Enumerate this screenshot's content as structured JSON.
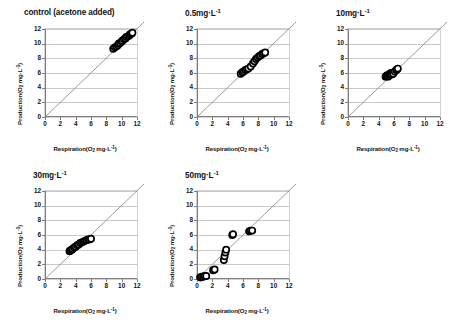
{
  "figure": {
    "axis_titles": {
      "x": "Respiration(O2 mg·L-1)",
      "y": "Production(O2 mg·L-1)"
    },
    "ticks": {
      "x": [
        "0",
        "2",
        "4",
        "6",
        "8",
        "10",
        "12"
      ],
      "y": [
        "0",
        "2",
        "4",
        "6",
        "8",
        "10",
        "12"
      ]
    },
    "colors": {
      "gridline": "#c9c9c9",
      "axis": "#7f7f7f",
      "reference_line": "#808080",
      "marker_stroke": "#000000",
      "marker_fill": "#ffffff",
      "text": "#131313",
      "background": "#ffffff"
    }
  },
  "chart_data": [
    {
      "type": "scatter",
      "title": "control (acetone added)",
      "xlabel": "Respiration(O2 mg·L-1)",
      "ylabel": "Production(O2 mg·L-1)",
      "xlim": [
        0,
        12
      ],
      "ylim": [
        0,
        12
      ],
      "xticks": [
        0,
        2,
        4,
        6,
        8,
        10,
        12
      ],
      "yticks": [
        0,
        2,
        4,
        6,
        8,
        10,
        12
      ],
      "grid": "horizontal",
      "reference_line": {
        "type": "identity",
        "slope": 1,
        "intercept": 0,
        "label": "1:1 line"
      },
      "x": [
        8.9,
        9.1,
        9.3,
        9.5,
        9.6,
        9.8,
        10.0,
        10.1,
        10.3,
        10.5,
        10.6,
        10.8,
        11.0,
        11.1,
        11.3,
        11.4
      ],
      "y": [
        9.3,
        9.5,
        9.6,
        9.8,
        10.0,
        10.1,
        10.3,
        10.4,
        10.6,
        10.7,
        10.9,
        11.0,
        11.1,
        11.3,
        11.4,
        11.5
      ]
    },
    {
      "type": "scatter",
      "title": "0.5mg·L-1",
      "xlabel": "Respiration(O2 mg·L-1)",
      "ylabel": "Production(O2 mg·L-1)",
      "xlim": [
        0,
        12
      ],
      "ylim": [
        0,
        12
      ],
      "xticks": [
        0,
        2,
        4,
        6,
        8,
        10,
        12
      ],
      "yticks": [
        0,
        2,
        4,
        6,
        8,
        10,
        12
      ],
      "grid": "horizontal",
      "reference_line": {
        "type": "identity",
        "slope": 1,
        "intercept": 0,
        "label": "1:1 line"
      },
      "x": [
        5.7,
        5.9,
        6.1,
        6.3,
        6.5,
        6.7,
        7.0,
        7.3,
        7.5,
        7.7,
        7.9,
        8.1,
        8.3,
        8.5,
        8.7,
        8.9
      ],
      "y": [
        5.9,
        6.1,
        6.2,
        6.4,
        6.5,
        6.6,
        6.9,
        7.3,
        7.6,
        7.9,
        8.1,
        8.3,
        8.4,
        8.6,
        8.7,
        8.8
      ]
    },
    {
      "type": "scatter",
      "title": "10mg·L-1",
      "xlabel": "Respiration(O2 mg·L-1)",
      "ylabel": "Production(O2 mg·L-1)",
      "xlim": [
        0,
        12
      ],
      "ylim": [
        0,
        12
      ],
      "xticks": [
        0,
        2,
        4,
        6,
        8,
        10,
        12
      ],
      "yticks": [
        0,
        2,
        4,
        6,
        8,
        10,
        12
      ],
      "grid": "horizontal",
      "reference_line": {
        "type": "identity",
        "slope": 1,
        "intercept": 0,
        "label": "1:1 line"
      },
      "x": [
        4.9,
        5.0,
        5.1,
        5.2,
        5.3,
        5.4,
        5.5,
        5.6,
        5.7,
        5.9,
        6.1,
        6.3,
        6.4,
        6.5
      ],
      "y": [
        5.5,
        5.6,
        5.7,
        5.5,
        5.6,
        5.8,
        5.9,
        6.0,
        5.8,
        5.9,
        6.2,
        6.4,
        6.5,
        6.6
      ]
    },
    {
      "type": "scatter",
      "title": "30mg·L-1",
      "xlabel": "Respiration(O2 mg·L-1)",
      "ylabel": "Production(O2 mg·L-1)",
      "xlim": [
        0,
        12
      ],
      "ylim": [
        0,
        12
      ],
      "xticks": [
        0,
        2,
        4,
        6,
        8,
        10,
        12
      ],
      "yticks": [
        0,
        2,
        4,
        6,
        8,
        10,
        12
      ],
      "grid": "horizontal",
      "reference_line": {
        "type": "identity",
        "slope": 1,
        "intercept": 0,
        "label": "1:1 line"
      },
      "x": [
        3.2,
        3.3,
        3.5,
        3.6,
        3.8,
        4.0,
        4.2,
        4.4,
        4.6,
        4.8,
        5.0,
        5.2,
        5.4,
        5.6,
        5.8,
        6.0
      ],
      "y": [
        3.8,
        3.9,
        4.0,
        4.1,
        4.3,
        4.4,
        4.6,
        4.7,
        4.9,
        5.0,
        5.1,
        5.2,
        5.3,
        5.4,
        5.4,
        5.5
      ]
    },
    {
      "type": "scatter",
      "title": "50mg·L-1",
      "xlabel": "Respiration(O2 mg·L-1)",
      "ylabel": "Production(O2 mg·L-1)",
      "xlim": [
        0,
        12
      ],
      "ylim": [
        0,
        12
      ],
      "xticks": [
        0,
        2,
        4,
        6,
        8,
        10,
        12
      ],
      "yticks": [
        0,
        2,
        4,
        6,
        8,
        10,
        12
      ],
      "grid": "horizontal",
      "reference_line": {
        "type": "identity",
        "slope": 1,
        "intercept": 0,
        "label": "1:1 line"
      },
      "x": [
        0.4,
        0.6,
        0.8,
        1.0,
        1.2,
        2.1,
        2.3,
        3.5,
        3.6,
        3.7,
        3.8,
        4.6,
        4.7,
        6.8,
        7.0,
        7.2
      ],
      "y": [
        0.2,
        0.3,
        0.3,
        0.4,
        0.4,
        1.2,
        1.3,
        2.6,
        3.1,
        3.6,
        4.0,
        6.0,
        6.1,
        6.5,
        6.6,
        6.6
      ]
    }
  ],
  "panels": [
    {
      "id": "control",
      "title": "control (acetone added)"
    },
    {
      "id": "dose-0-5",
      "title": "0.5mg·L-1"
    },
    {
      "id": "dose-10",
      "title": "10mg·L-1"
    },
    {
      "id": "dose-30",
      "title": "30mg·L-1"
    },
    {
      "id": "dose-50",
      "title": "50mg·L-1"
    }
  ]
}
